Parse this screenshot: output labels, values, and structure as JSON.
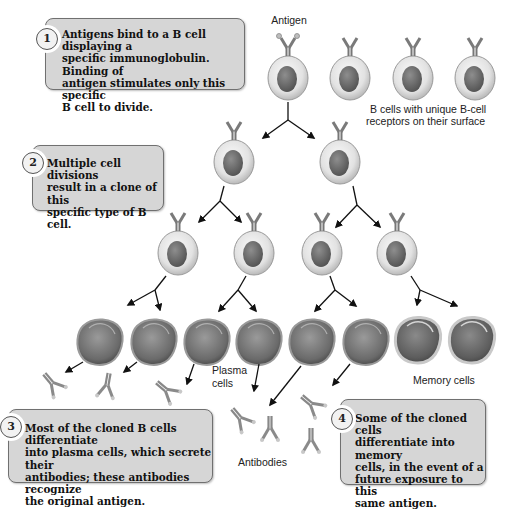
{
  "diagram": {
    "topic": "Clonal selection of B cells",
    "labels": {
      "antigen": "Antigen",
      "unique_receptors_line1": "B cells with unique B-cell",
      "unique_receptors_line2": "receptors on their surface",
      "plasma_line1": "Plasma",
      "plasma_line2": "cells",
      "memory_cells": "Memory cells",
      "antibodies": "Antibodies"
    },
    "steps": [
      {
        "number": "1",
        "lines": [
          "Antigens bind to a B cell displaying a",
          "specific immunoglobulin. Binding of",
          "antigen stimulates only this specific",
          "B cell to divide."
        ]
      },
      {
        "number": "2",
        "lines": [
          "Multiple cell divisions",
          "result in a clone of this",
          "specific type of B cell."
        ]
      },
      {
        "number": "3",
        "lines": [
          "Most of the cloned B cells differentiate",
          "into plasma cells, which secrete their",
          "antibodies; these antibodies recognize",
          "the original antigen."
        ]
      },
      {
        "number": "4",
        "lines": [
          "Some of the cloned cells",
          "differentiate into memory",
          "cells, in the event of a",
          "future exposure to this",
          "same antigen."
        ]
      }
    ],
    "colors": {
      "callout_fill": "#d6d6d6",
      "callout_border": "#707070",
      "cell_membrane": "#e6e6e6",
      "nucleus": "#6e6e6e",
      "plasma_cell": "#7a7a7a",
      "arrow": "#111111"
    }
  }
}
